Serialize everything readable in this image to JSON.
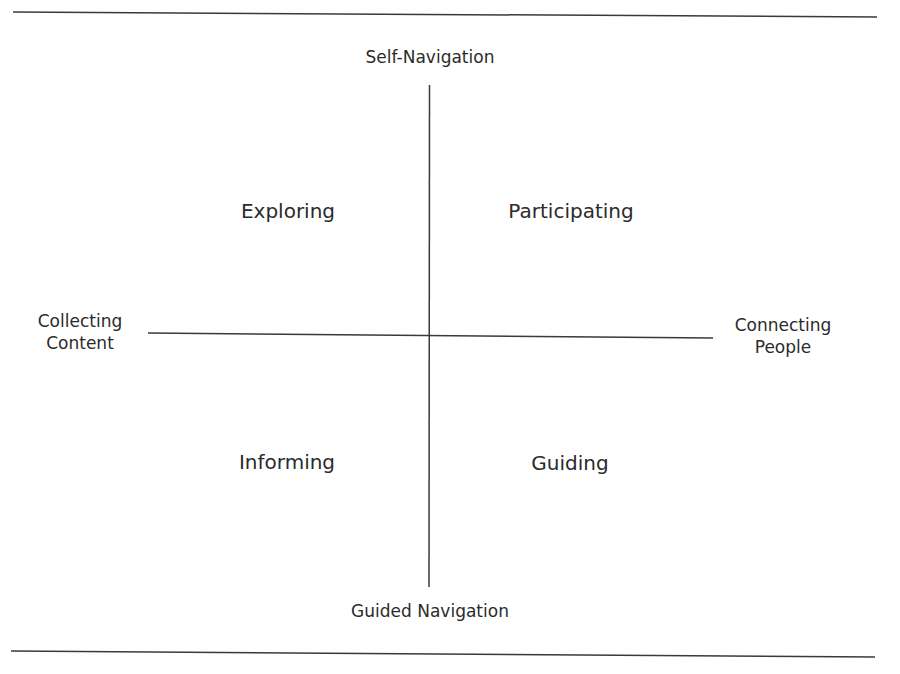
{
  "diagram": {
    "type": "quadrant-matrix",
    "axes": {
      "vertical": {
        "top_label": "Self-Navigation",
        "bottom_label": "Guided Navigation"
      },
      "horizontal": {
        "left_label_line1": "Collecting",
        "left_label_line2": "Content",
        "right_label_line1": "Connecting",
        "right_label_line2": "People"
      }
    },
    "quadrants": {
      "top_left": "Exploring",
      "top_right": "Participating",
      "bottom_left": "Informing",
      "bottom_right": "Guiding"
    },
    "colors": {
      "line": "#3a3a3a",
      "text": "#2b2b2b",
      "background": "#ffffff"
    }
  }
}
